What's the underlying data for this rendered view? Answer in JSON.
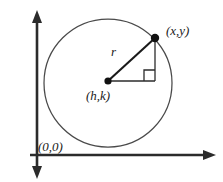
{
  "diagram": {
    "type": "geometry-diagram",
    "colors": {
      "stroke": "#2b2b2b",
      "circle_stroke": "#4a4a4a",
      "axis": "#2b2b2b",
      "text": "#1a1a1a",
      "background": "#ffffff"
    },
    "labels": {
      "point_on_circle": "(x,y)",
      "center": "(h,k)",
      "radius": "r",
      "origin": "(0,0)"
    },
    "geometry": {
      "circle": {
        "center_x": 108,
        "center_y": 83,
        "radius": 64
      },
      "center_point": {
        "x": 108,
        "y": 81
      },
      "circumference_point": {
        "x": 155,
        "y": 38
      },
      "right_angle_vertex": {
        "x": 155,
        "y": 81
      },
      "right_angle_marker_size": 11,
      "axes": {
        "y_axis_x": 37,
        "y_axis_top": 11,
        "y_axis_bottom": 178,
        "x_axis_y": 155,
        "x_axis_left": 30,
        "x_axis_right": 215
      }
    }
  }
}
